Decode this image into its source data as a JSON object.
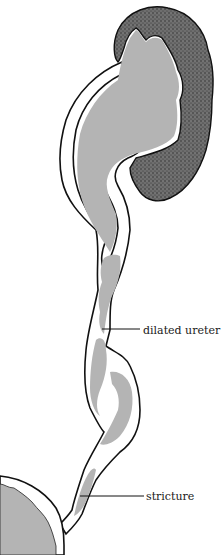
{
  "diagram": {
    "labels": {
      "dilated_ureter": "dilated ureter",
      "stricture": "stricture"
    },
    "structures": [
      {
        "name": "kidney-cortex",
        "fill": "#5a5a5a",
        "pattern": "stippled"
      },
      {
        "name": "dilated-renal-pelvis",
        "fill": "#b4b4b4"
      },
      {
        "name": "dilated-ureter",
        "fill": "#b4b4b4"
      },
      {
        "name": "ureteral-wall",
        "stroke": "#111111",
        "fill": "#ffffff"
      },
      {
        "name": "bladder",
        "fill": "#b4b4b4"
      }
    ],
    "colors": {
      "outline": "#111111",
      "lumen": "#b4b4b4",
      "cortex": "#5a5a5a",
      "background": "#ffffff"
    }
  }
}
